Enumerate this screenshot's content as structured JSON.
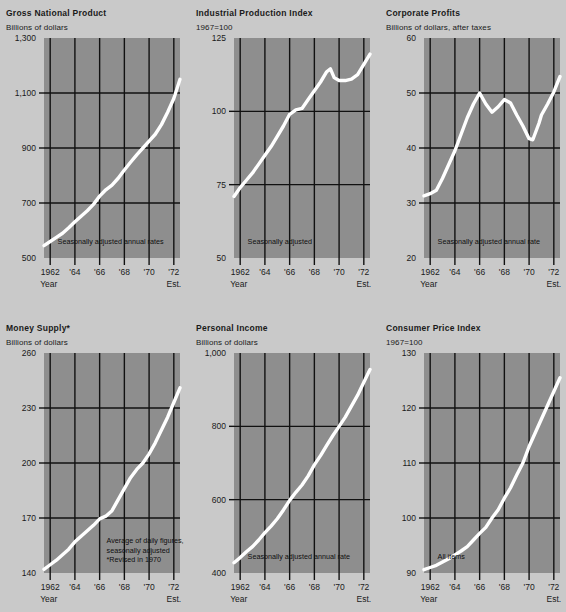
{
  "page": {
    "background_color": "#c9c9c9",
    "plot_fill_color": "#8e8e8e",
    "grid_color": "#111111",
    "line_color": "#ffffff",
    "axis_name": "Year",
    "est_label": "Est."
  },
  "charts": [
    {
      "id": "gross-national-product",
      "title": "Gross National Product",
      "units": "Billions of dollars",
      "note": "Seasonally adjusted annual rates",
      "chart_data": {
        "type": "line",
        "title": "Gross National Product",
        "ylabel": "Billions of dollars",
        "xlabel": "Year",
        "ylim": [
          500,
          1300
        ],
        "xlim": [
          1961.5,
          1972.5
        ],
        "yticks": [
          500,
          700,
          900,
          1100,
          1300
        ],
        "ytick_labels": [
          "500",
          "700",
          "900",
          "1,100",
          "1,300"
        ],
        "xticks": [
          1962,
          1964,
          1966,
          1968,
          1970,
          1972
        ],
        "xtick_labels": [
          "1962",
          "'64",
          "'66",
          "'68",
          "'70",
          "'72"
        ],
        "grid": true,
        "legend": "none",
        "annotations": [
          "Seasonally adjusted annual rates"
        ],
        "x": [
          1961.5,
          1962,
          1962.5,
          1963,
          1963.5,
          1964,
          1964.5,
          1965,
          1965.5,
          1966,
          1966.5,
          1967,
          1967.5,
          1968,
          1968.5,
          1969,
          1969.5,
          1970,
          1970.5,
          1971,
          1971.5,
          1972,
          1972.5
        ],
        "values": [
          545,
          560,
          575,
          590,
          610,
          632,
          652,
          672,
          695,
          725,
          748,
          765,
          790,
          820,
          848,
          875,
          900,
          925,
          950,
          985,
          1030,
          1080,
          1150
        ]
      }
    },
    {
      "id": "industrial-production-index",
      "title": "Industrial Production Index",
      "units": "1967=100",
      "note": "Seasonally adjusted",
      "chart_data": {
        "type": "line",
        "title": "Industrial Production Index",
        "ylabel": "1967=100",
        "xlabel": "Year",
        "ylim": [
          50,
          125
        ],
        "xlim": [
          1961.5,
          1972.5
        ],
        "yticks": [
          50,
          75,
          100,
          125
        ],
        "ytick_labels": [
          "50",
          "75",
          "100",
          "125"
        ],
        "xticks": [
          1962,
          1964,
          1966,
          1968,
          1970,
          1972
        ],
        "xtick_labels": [
          "1962",
          "'64",
          "'66",
          "'68",
          "'70",
          "'72"
        ],
        "grid": true,
        "legend": "none",
        "annotations": [
          "Seasonally adjusted"
        ],
        "x": [
          1961.5,
          1962,
          1962.5,
          1963,
          1963.5,
          1964,
          1964.5,
          1965,
          1965.5,
          1966,
          1966.5,
          1967,
          1967.5,
          1968,
          1968.5,
          1969,
          1969.3,
          1969.6,
          1970,
          1970.5,
          1971,
          1971.5,
          1972,
          1972.5
        ],
        "values": [
          71,
          74,
          76.5,
          79,
          82,
          85,
          88,
          91.5,
          95,
          99,
          100.5,
          101,
          104,
          107,
          110,
          113.5,
          114.5,
          111.5,
          110.5,
          110.5,
          111,
          112.5,
          116,
          119.5
        ]
      }
    },
    {
      "id": "corporate-profits",
      "title": "Corporate Profits",
      "units": "Billions of dollars, after taxes",
      "note": "Seasonally adjusted annual rate",
      "chart_data": {
        "type": "line",
        "title": "Corporate Profits",
        "ylabel": "Billions of dollars, after taxes",
        "xlabel": "Year",
        "ylim": [
          20,
          60
        ],
        "xlim": [
          1961.5,
          1972.5
        ],
        "yticks": [
          20,
          30,
          40,
          50,
          60
        ],
        "ytick_labels": [
          "20",
          "30",
          "40",
          "50",
          "60"
        ],
        "xticks": [
          1962,
          1964,
          1966,
          1968,
          1970,
          1972
        ],
        "xtick_labels": [
          "1962",
          "'64",
          "'66",
          "'68",
          "'70",
          "'72"
        ],
        "grid": true,
        "legend": "none",
        "annotations": [
          "Seasonally adjusted annual rate"
        ],
        "x": [
          1961.5,
          1962,
          1962.5,
          1963,
          1963.5,
          1964,
          1964.5,
          1965,
          1965.5,
          1966,
          1966.5,
          1967,
          1967.5,
          1968,
          1968.5,
          1969,
          1969.5,
          1970,
          1970.3,
          1970.8,
          1971,
          1971.5,
          1972,
          1972.5
        ],
        "values": [
          31.3,
          31.7,
          32.3,
          34.5,
          37,
          39.5,
          42.5,
          45.5,
          48,
          50,
          48,
          46.5,
          47.5,
          48.8,
          48.2,
          46,
          44,
          41.7,
          41.5,
          44.5,
          46,
          48,
          50.2,
          53
        ]
      }
    },
    {
      "id": "money-supply",
      "title": "Money Supply*",
      "units": "Billions of dollars",
      "note": "Average of daily figures,\nseasonally adjusted\n*Revised in 1970",
      "note_lines": [
        "Average of daily figures,",
        "seasonally adjusted",
        "*Revised in 1970"
      ],
      "chart_data": {
        "type": "line",
        "title": "Money Supply*",
        "ylabel": "Billions of dollars",
        "xlabel": "Year",
        "ylim": [
          140,
          260
        ],
        "xlim": [
          1961.5,
          1972.5
        ],
        "yticks": [
          140,
          170,
          200,
          230,
          260
        ],
        "ytick_labels": [
          "140",
          "170",
          "200",
          "230",
          "260"
        ],
        "xticks": [
          1962,
          1964,
          1966,
          1968,
          1970,
          1972
        ],
        "xtick_labels": [
          "1962",
          "'64",
          "'66",
          "'68",
          "'70",
          "'72"
        ],
        "grid": true,
        "legend": "none",
        "annotations": [
          "Average of daily figures,",
          "seasonally adjusted",
          "*Revised in 1970"
        ],
        "x": [
          1961.5,
          1962,
          1962.5,
          1963,
          1963.5,
          1964,
          1964.5,
          1965,
          1965.5,
          1966,
          1966.5,
          1967,
          1967.5,
          1968,
          1968.5,
          1969,
          1969.5,
          1970,
          1970.5,
          1971,
          1971.5,
          1972,
          1972.5
        ],
        "values": [
          142,
          144.5,
          147,
          150,
          153,
          157,
          160,
          163,
          166,
          169.5,
          171,
          174,
          180,
          186,
          192,
          196.5,
          200,
          205,
          211,
          218,
          225,
          233,
          241
        ]
      }
    },
    {
      "id": "personal-income",
      "title": "Personal Income",
      "units": "Billions of dollars",
      "note": "Seasonally adjusted annual rate",
      "chart_data": {
        "type": "line",
        "title": "Personal Income",
        "ylabel": "Billions of dollars",
        "xlabel": "Year",
        "ylim": [
          400,
          1000
        ],
        "xlim": [
          1961.5,
          1972.5
        ],
        "yticks": [
          400,
          600,
          800,
          1000
        ],
        "ytick_labels": [
          "400",
          "600",
          "800",
          "1,000"
        ],
        "xticks": [
          1962,
          1964,
          1966,
          1968,
          1970,
          1972
        ],
        "xtick_labels": [
          "1962",
          "'64",
          "'66",
          "'68",
          "'70",
          "'72"
        ],
        "grid": true,
        "legend": "none",
        "annotations": [
          "Seasonally adjusted annual rate"
        ],
        "x": [
          1961.5,
          1962,
          1962.5,
          1963,
          1963.5,
          1964,
          1964.5,
          1965,
          1965.5,
          1966,
          1966.5,
          1967,
          1967.5,
          1968,
          1968.5,
          1969,
          1969.5,
          1970,
          1970.5,
          1971,
          1971.5,
          1972,
          1972.5
        ],
        "values": [
          428,
          442,
          458,
          472,
          490,
          510,
          528,
          548,
          572,
          598,
          620,
          640,
          665,
          695,
          720,
          748,
          775,
          800,
          825,
          855,
          885,
          920,
          955
        ]
      }
    },
    {
      "id": "consumer-price-index",
      "title": "Consumer Price Index",
      "units": "1967=100",
      "note": "All items",
      "chart_data": {
        "type": "line",
        "title": "Consumer Price Index",
        "ylabel": "1967=100",
        "xlabel": "Year",
        "ylim": [
          90,
          130
        ],
        "xlim": [
          1961.5,
          1972.5
        ],
        "yticks": [
          90,
          100,
          110,
          120,
          130
        ],
        "ytick_labels": [
          "90",
          "100",
          "110",
          "120",
          "130"
        ],
        "xticks": [
          1962,
          1964,
          1966,
          1968,
          1970,
          1972
        ],
        "xtick_labels": [
          "1962",
          "'64",
          "'66",
          "'68",
          "'70",
          "'72"
        ],
        "grid": true,
        "legend": "none",
        "annotations": [
          "All items"
        ],
        "x": [
          1961.5,
          1962,
          1962.5,
          1963,
          1963.5,
          1964,
          1964.5,
          1965,
          1965.5,
          1966,
          1966.5,
          1967,
          1967.5,
          1968,
          1968.5,
          1969,
          1969.5,
          1970,
          1970.5,
          1971,
          1971.5,
          1972,
          1972.5
        ],
        "values": [
          90.6,
          91.0,
          91.4,
          92.0,
          92.6,
          93.3,
          94.0,
          94.8,
          96.0,
          97.2,
          98.3,
          100.0,
          101.5,
          103.6,
          105.5,
          107.8,
          110.0,
          113.0,
          115.5,
          118.0,
          120.5,
          123.0,
          125.5
        ]
      }
    }
  ]
}
